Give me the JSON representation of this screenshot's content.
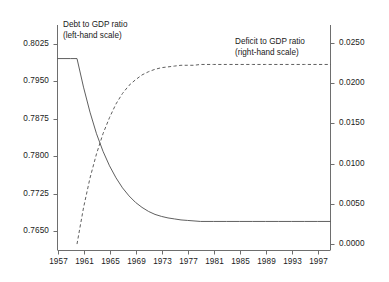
{
  "chart_data": {
    "type": "line",
    "title": "",
    "subtitle": "",
    "xlabel": "",
    "ylabel": "",
    "grid": false,
    "legend_position": "inline-annotations",
    "xlim": [
      1957,
      1999
    ],
    "xticks": [
      "1957",
      "1961",
      "1965",
      "1969",
      "1973",
      "1977",
      "1981",
      "1985",
      "1989",
      "1993",
      "1997"
    ],
    "xtick_values": [
      1957,
      1961,
      1965,
      1969,
      1973,
      1977,
      1981,
      1985,
      1989,
      1993,
      1997
    ],
    "left_axis": {
      "label": "Debt to GDP ratio",
      "scale_note": "(left-hand scale)",
      "ylim": [
        0.7612,
        0.8062
      ],
      "yticks": [
        "0.8025",
        "0.7950",
        "0.7875",
        "0.7800",
        "0.7725",
        "0.7650"
      ],
      "ytick_values": [
        0.8025,
        0.795,
        0.7875,
        0.78,
        0.7725,
        0.765
      ]
    },
    "right_axis": {
      "label": "Deficit to GDP ratio",
      "scale_note": "(right-hand scale)",
      "ylim": [
        -0.0008,
        0.0272
      ],
      "yticks": [
        "0.0250",
        "0.0200",
        "0.0150",
        "0.0100",
        "0.0050",
        "0.0000"
      ],
      "ytick_values": [
        0.025,
        0.02,
        0.015,
        0.01,
        0.005,
        0.0
      ]
    },
    "series": [
      {
        "name": "Debt to GDP ratio",
        "axis": "left",
        "style": "solid",
        "color": "#4d4d4d",
        "x": [
          1957,
          1958,
          1959,
          1960,
          1961,
          1962,
          1963,
          1964,
          1965,
          1966,
          1967,
          1968,
          1969,
          1970,
          1971,
          1972,
          1973,
          1974,
          1975,
          1976,
          1977,
          1978,
          1979,
          1980,
          1981,
          1982,
          1983,
          1984,
          1985,
          1986,
          1987,
          1988,
          1989,
          1990,
          1991,
          1992,
          1993,
          1994,
          1995,
          1996,
          1997,
          1998,
          1999
        ],
        "values": [
          0.7995,
          0.7995,
          0.7995,
          0.7995,
          0.7938,
          0.7888,
          0.7845,
          0.781,
          0.7781,
          0.7757,
          0.7737,
          0.7721,
          0.7708,
          0.7698,
          0.769,
          0.7684,
          0.768,
          0.7677,
          0.7675,
          0.7673,
          0.7672,
          0.7671,
          0.767,
          0.767,
          0.767,
          0.767,
          0.767,
          0.767,
          0.767,
          0.767,
          0.767,
          0.767,
          0.767,
          0.767,
          0.767,
          0.767,
          0.767,
          0.767,
          0.767,
          0.767,
          0.767,
          0.767,
          0.767
        ]
      },
      {
        "name": "Deficit to GDP ratio",
        "axis": "right",
        "style": "dashed",
        "color": "#4d4d4d",
        "x": [
          1960,
          1961,
          1962,
          1963,
          1964,
          1965,
          1966,
          1967,
          1968,
          1969,
          1970,
          1971,
          1972,
          1973,
          1974,
          1975,
          1976,
          1977,
          1978,
          1979,
          1980,
          1981,
          1982,
          1983,
          1984,
          1985,
          1986,
          1987,
          1988,
          1989,
          1990,
          1991,
          1992,
          1993,
          1994,
          1995,
          1996,
          1997,
          1998,
          1999
        ],
        "values": [
          0.0,
          0.0045,
          0.0082,
          0.0112,
          0.0137,
          0.0157,
          0.0174,
          0.0187,
          0.0197,
          0.0204,
          0.021,
          0.0214,
          0.0217,
          0.0219,
          0.022,
          0.0221,
          0.0222,
          0.0222,
          0.0222,
          0.0223,
          0.0223,
          0.0223,
          0.0223,
          0.0223,
          0.0223,
          0.0223,
          0.0223,
          0.0223,
          0.0223,
          0.0223,
          0.0223,
          0.0223,
          0.0223,
          0.0223,
          0.0223,
          0.0223,
          0.0223,
          0.0223,
          0.0223,
          0.0223
        ]
      }
    ],
    "annotations": [
      {
        "text_line1": "Debt to GDP ratio",
        "text_line2": "(left-hand scale)"
      },
      {
        "text_line1": "Deficit to GDP ratio",
        "text_line2": "(right-hand scale)"
      }
    ],
    "colors": {
      "axis": "#6e6e6e",
      "line": "#4d4d4d",
      "background": "#ffffff",
      "text": "#1a1a1a"
    }
  }
}
